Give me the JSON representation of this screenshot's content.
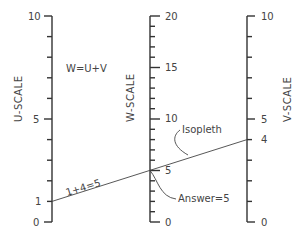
{
  "title": "W=U+V",
  "scales": {
    "u": {
      "label": "U-SCALE",
      "min": 0,
      "max": 10,
      "tick_labels": [
        "0",
        "1",
        "5",
        "10"
      ]
    },
    "w": {
      "label": "W-SCALE",
      "min": 0,
      "max": 20,
      "tick_labels": [
        "0",
        "5",
        "10",
        "15",
        "20"
      ]
    },
    "v": {
      "label": "V-SCALE",
      "min": 0,
      "max": 10,
      "tick_labels": [
        "0",
        "4",
        "5",
        "10"
      ]
    }
  },
  "isopleth": {
    "label": "Isopleth",
    "equation": "1+4=5",
    "answer": "Answer=5",
    "u": 1,
    "v": 4,
    "w": 5
  },
  "colors": {
    "line": "#333333",
    "text": "#444444"
  }
}
